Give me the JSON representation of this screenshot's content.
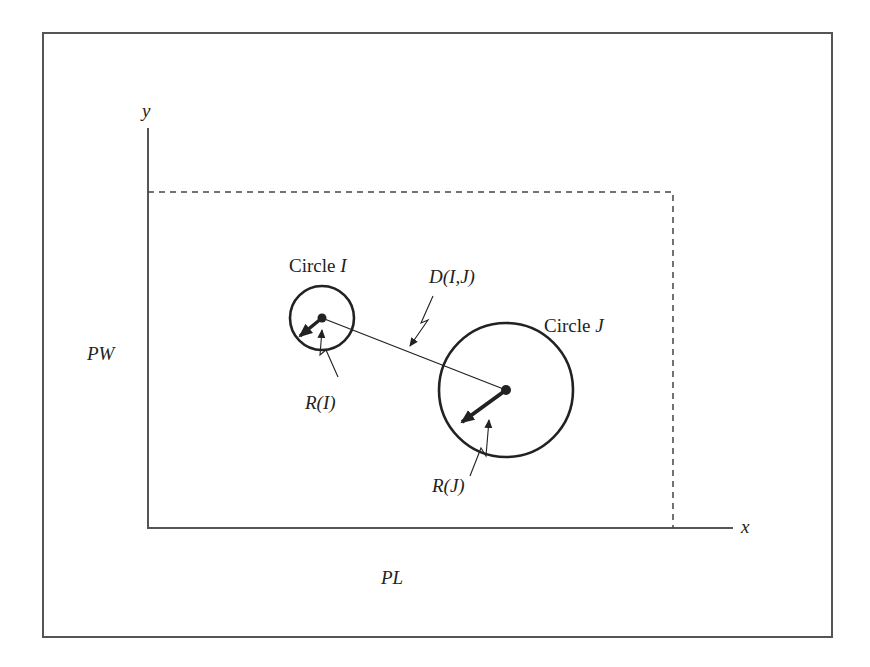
{
  "diagram": {
    "axes": {
      "y_label": "y",
      "x_label": "x"
    },
    "dimensions": {
      "width_label": "PW",
      "length_label": "PL"
    },
    "circles": [
      {
        "label_prefix": "Circle ",
        "label_var": "I",
        "radius_label": "R(I)",
        "cx": 322,
        "cy": 318,
        "r": 32
      },
      {
        "label_prefix": "Circle ",
        "label_var": "J",
        "radius_label": "R(J)",
        "cx": 506,
        "cy": 390,
        "r": 67
      }
    ],
    "distance_label": "D(I,J)",
    "colors": {
      "stroke": "#222222",
      "frame": "#555555"
    }
  }
}
